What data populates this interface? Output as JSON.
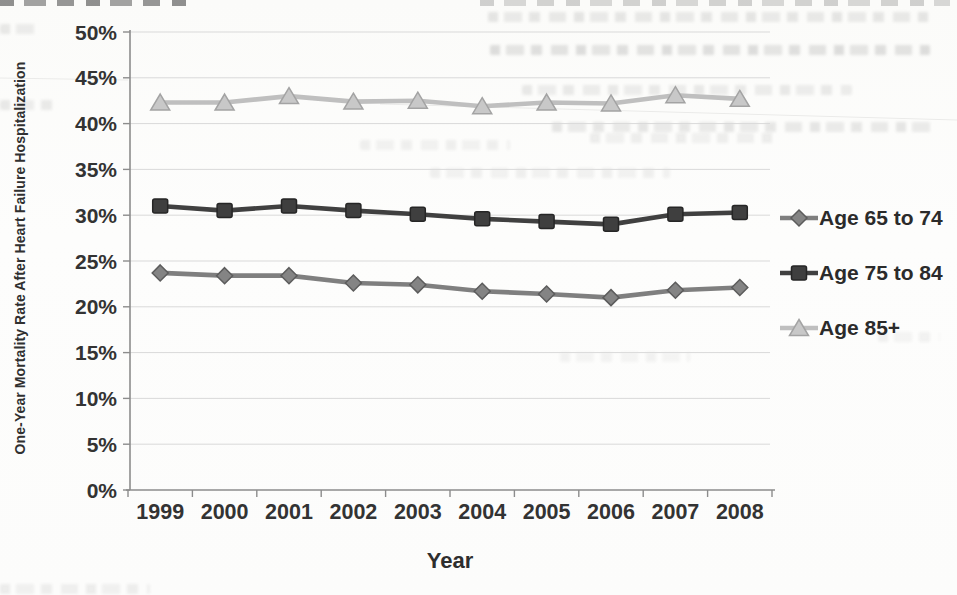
{
  "chart_data": {
    "type": "line",
    "title": "",
    "xlabel": "Year",
    "ylabel": "One-Year Mortality Rate After Heart Failure Hospitalization",
    "x": [
      1999,
      2000,
      2001,
      2002,
      2003,
      2004,
      2005,
      2006,
      2007,
      2008
    ],
    "x_tick_labels": [
      "1999",
      "2000",
      "2001",
      "2002",
      "2003",
      "2004",
      "2005",
      "2006",
      "2007",
      "2008"
    ],
    "ylim": [
      0,
      50
    ],
    "y_tick_step": 5,
    "y_tick_labels": [
      "0%",
      "5%",
      "10%",
      "15%",
      "20%",
      "25%",
      "30%",
      "35%",
      "40%",
      "45%",
      "50%"
    ],
    "grid": true,
    "legend_position": "right",
    "grid_color": "#d9d9d9",
    "axis_color": "#8c8c8c",
    "tick_label_color": "#333333",
    "series": [
      {
        "name": "Age 65 to 74",
        "marker": "diamond",
        "color": "#7f7f7f",
        "marker_fill": "#848484",
        "marker_stroke": "#5c5c5c",
        "values": [
          23.7,
          23.4,
          23.4,
          22.6,
          22.4,
          21.7,
          21.4,
          21.0,
          21.8,
          22.1
        ]
      },
      {
        "name": "Age 75 to 84",
        "marker": "square",
        "color": "#404040",
        "marker_fill": "#3f3f3f",
        "marker_stroke": "#262626",
        "values": [
          31.0,
          30.5,
          31.0,
          30.5,
          30.1,
          29.6,
          29.3,
          29.0,
          30.1,
          30.3
        ]
      },
      {
        "name": "Age 85+",
        "marker": "triangle",
        "color": "#bfbfbf",
        "marker_fill": "#c8c8c8",
        "marker_stroke": "#a3a3a3",
        "values": [
          42.3,
          42.3,
          43.0,
          42.4,
          42.5,
          41.9,
          42.3,
          42.2,
          43.1,
          42.7
        ]
      }
    ]
  }
}
